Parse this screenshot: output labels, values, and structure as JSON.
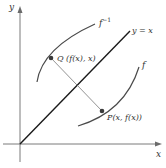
{
  "diagram": {
    "axes": {
      "x_label": "x",
      "y_label": "y"
    },
    "line": {
      "label": "y = x"
    },
    "curves": [
      {
        "name": "f",
        "label": "f"
      },
      {
        "name": "f_inverse",
        "label": "f",
        "label_superscript": "−1"
      }
    ],
    "points": [
      {
        "name": "P",
        "label": "P(x, f(x))"
      },
      {
        "name": "Q",
        "label": "Q (f(x), x)"
      }
    ],
    "colors": {
      "axis": "#6b6b6b",
      "identity_line": "#1a1a1a",
      "curve": "#4a4a4a",
      "connector": "#777777",
      "point": "#3a3a3a",
      "text": "#333333"
    }
  }
}
